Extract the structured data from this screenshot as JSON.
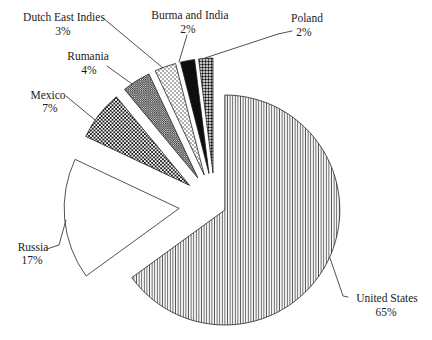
{
  "figure": {
    "background": "#ffffff",
    "text_color": "#1b1b1b",
    "leader_line_color": "#3c3c3c",
    "slice_outline_color": "#1a1a1a"
  },
  "chart_data": {
    "type": "pie",
    "title": "",
    "unit": "percent",
    "direction": "clockwise",
    "start_angle_deg": 0,
    "legend_position": "none",
    "labels_style": "outside-with-leader-lines",
    "slices": [
      {
        "label": "United States",
        "value": 65,
        "pct_label": "65%",
        "pattern": "vertical-lines",
        "exploded": false
      },
      {
        "label": "Russia",
        "value": 17,
        "pct_label": "17%",
        "pattern": "plain-white",
        "exploded": true
      },
      {
        "label": "Mexico",
        "value": 7,
        "pct_label": "7%",
        "pattern": "checkerboard",
        "exploded": true
      },
      {
        "label": "Rumania",
        "value": 4,
        "pct_label": "4%",
        "pattern": "fine-checker",
        "exploded": true
      },
      {
        "label": "Dutch East Indies",
        "value": 3,
        "pct_label": "3%",
        "pattern": "light-dots",
        "exploded": true
      },
      {
        "label": "Burma and India",
        "value": 2,
        "pct_label": "2%",
        "pattern": "solid-black",
        "exploded": true
      },
      {
        "label": "Poland",
        "value": 2,
        "pct_label": "2%",
        "pattern": "dark-dots",
        "exploded": true
      }
    ]
  }
}
